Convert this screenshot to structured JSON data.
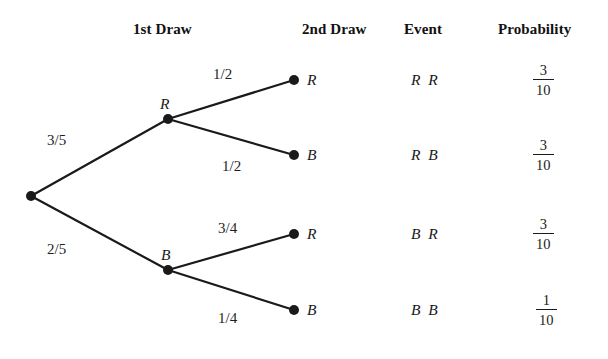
{
  "headers": [
    {
      "label": "1st Draw",
      "x": 133,
      "y": 22
    },
    {
      "label": "2nd Draw",
      "x": 302,
      "y": 22
    },
    {
      "label": "Event",
      "x": 404,
      "y": 22
    },
    {
      "label": "Probability",
      "x": 498,
      "y": 22
    }
  ],
  "diagram": {
    "line_color": "#1a1a1a",
    "node_color": "#1a1a1a",
    "line_width": 2.2,
    "node_radius": 5.0,
    "root": {
      "x": 31,
      "y": 196
    },
    "level1": [
      {
        "name": "R",
        "x": 168,
        "y": 119,
        "label": "R",
        "label_x": 160,
        "label_y": 96,
        "weight": "3/5",
        "weight_x": 47,
        "weight_y": 133
      },
      {
        "name": "B",
        "x": 168,
        "y": 270,
        "label": "B",
        "label_x": 161,
        "label_y": 247,
        "weight": "2/5",
        "weight_x": 47,
        "weight_y": 242
      }
    ],
    "leaves": [
      {
        "parent": "R",
        "label": "R",
        "x": 294,
        "y": 80,
        "label_x": 307,
        "label_y": 72,
        "weight": "1/2",
        "weight_x": 213,
        "weight_y": 67
      },
      {
        "parent": "R",
        "label": "B",
        "x": 294,
        "y": 155,
        "label_x": 307,
        "label_y": 147,
        "weight": "1/2",
        "weight_x": 222,
        "weight_y": 159
      },
      {
        "parent": "B",
        "label": "R",
        "x": 294,
        "y": 234,
        "label_x": 307,
        "label_y": 226,
        "weight": "3/4",
        "weight_x": 218,
        "weight_y": 221
      },
      {
        "parent": "B",
        "label": "B",
        "x": 294,
        "y": 310,
        "label_x": 307,
        "label_y": 302,
        "weight": "1/4",
        "weight_x": 218,
        "weight_y": 311
      }
    ]
  },
  "rows": [
    {
      "event": "R R",
      "event_x": 411,
      "event_y": 72,
      "prob_numerator": "3",
      "prob_denominator": "10",
      "prob_x": 533,
      "prob_y": 62
    },
    {
      "event": "R B",
      "event_x": 411,
      "event_y": 147,
      "prob_numerator": "3",
      "prob_denominator": "10",
      "prob_x": 533,
      "prob_y": 137
    },
    {
      "event": "B R",
      "event_x": 411,
      "event_y": 226,
      "prob_numerator": "3",
      "prob_denominator": "10",
      "prob_x": 533,
      "prob_y": 216
    },
    {
      "event": "B B",
      "event_x": 411,
      "event_y": 302,
      "prob_numerator": "1",
      "prob_denominator": "10",
      "prob_x": 536,
      "prob_y": 292
    }
  ]
}
